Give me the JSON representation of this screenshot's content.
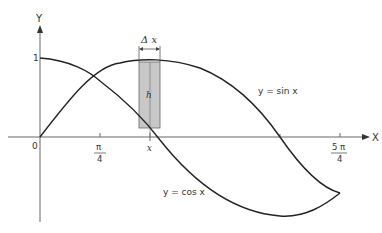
{
  "diagram": {
    "axes": {
      "x_label": "X",
      "y_label": "Y",
      "origin_label": "0",
      "y_tick_label": "1",
      "x_ticks": [
        {
          "num": "π",
          "den": "4"
        },
        {
          "label": "x"
        },
        {
          "num": "5 π",
          "den": "4"
        }
      ]
    },
    "curves": [
      {
        "name": "sin",
        "label": "y = sin x"
      },
      {
        "name": "cos",
        "label": "y = cos x"
      }
    ],
    "strip": {
      "width_label": "Δ x",
      "height_label": "h",
      "fill": "#c8c8c8"
    },
    "colors": {
      "axis": "#555555",
      "curve": "#222222",
      "strip": "#c8c8c8"
    }
  }
}
